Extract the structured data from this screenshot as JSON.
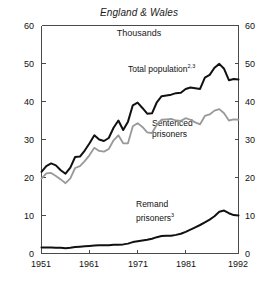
{
  "chart_data": {
    "type": "line",
    "title": "England & Wales",
    "subtitle": "Thousands",
    "xlabel": "",
    "ylabel": "Thousands",
    "xlim": [
      1951,
      1992
    ],
    "ylim": [
      0,
      60
    ],
    "yticks": [
      0,
      10,
      20,
      30,
      40,
      50,
      60
    ],
    "xticks": [
      1951,
      1961,
      1971,
      1981,
      1992
    ],
    "grid": false,
    "legend_position": "inline-annotations",
    "dual_axis": true,
    "x": [
      1951,
      1952,
      1953,
      1954,
      1955,
      1956,
      1957,
      1958,
      1959,
      1960,
      1961,
      1962,
      1963,
      1964,
      1965,
      1966,
      1967,
      1968,
      1969,
      1970,
      1971,
      1972,
      1973,
      1974,
      1975,
      1976,
      1977,
      1978,
      1979,
      1980,
      1981,
      1982,
      1983,
      1984,
      1985,
      1986,
      1987,
      1988,
      1989,
      1990,
      1991,
      1992
    ],
    "series": [
      {
        "name": "Total population",
        "footnote": "2,3",
        "color": "#111111",
        "values": [
          21.5,
          23.0,
          23.7,
          23.2,
          21.9,
          21.0,
          22.6,
          25.4,
          25.5,
          27.1,
          29.0,
          31.1,
          30.0,
          29.6,
          30.4,
          33.1,
          35.0,
          32.5,
          34.7,
          39.0,
          39.7,
          38.3,
          36.8,
          36.9,
          39.8,
          41.4,
          41.6,
          41.8,
          42.2,
          42.3,
          43.3,
          43.7,
          43.5,
          43.3,
          46.3,
          47.0,
          48.9,
          49.9,
          48.6,
          45.6,
          45.9,
          45.8
        ]
      },
      {
        "name": "Sentenced prisoners",
        "footnote": "",
        "color": "#999999",
        "values": [
          19.7,
          21.1,
          21.2,
          20.4,
          19.5,
          18.5,
          19.8,
          22.5,
          23.0,
          24.3,
          25.9,
          27.8,
          27.0,
          26.8,
          27.5,
          29.8,
          31.1,
          29.0,
          29.0,
          33.5,
          34.3,
          33.3,
          31.9,
          31.7,
          33.9,
          35.2,
          35.3,
          35.4,
          35.0,
          34.9,
          35.6,
          35.2,
          34.5,
          34.0,
          36.2,
          36.6,
          37.6,
          38.0,
          36.9,
          35.0,
          35.3,
          35.2
        ]
      },
      {
        "name": "Remand prisoners",
        "footnote": "3",
        "color": "#111111",
        "values": [
          1.6,
          1.6,
          1.6,
          1.5,
          1.5,
          1.4,
          1.5,
          1.7,
          1.8,
          1.9,
          2.0,
          2.1,
          2.2,
          2.2,
          2.2,
          2.3,
          2.3,
          2.4,
          2.6,
          3.0,
          3.2,
          3.4,
          3.6,
          3.9,
          4.3,
          4.6,
          4.7,
          4.7,
          4.9,
          5.2,
          5.7,
          6.3,
          6.9,
          7.5,
          8.2,
          8.9,
          9.8,
          11.0,
          11.3,
          10.6,
          10.1,
          10.0
        ]
      }
    ],
    "annotations": [
      {
        "id": "total-population",
        "text": "Total population",
        "sup": "2,3",
        "x_px": 128,
        "y_px": 66
      },
      {
        "id": "sentenced-prisoners",
        "text": "Sentenced",
        "text2": "prisoners",
        "sup": "",
        "x_px": 152,
        "y_px": 123
      },
      {
        "id": "remand-prisoners",
        "text": "Remand",
        "text2": "prisoners",
        "sup": "3",
        "x_px": 136,
        "y_px": 204
      }
    ]
  },
  "axis": {
    "y_left": [
      "60",
      "50",
      "40",
      "30",
      "20",
      "10",
      "0"
    ],
    "y_right": [
      "60",
      "50",
      "40",
      "30",
      "20",
      "10",
      "0"
    ],
    "x": [
      "1951",
      "1961",
      "1971",
      "1981",
      "1992"
    ]
  },
  "labels": {
    "title": "England & Wales",
    "subtitle": "Thousands",
    "total_population": "Total population",
    "total_population_sup": "2,3",
    "sentenced_line1": "Sentenced",
    "sentenced_line2": "prisoners",
    "remand_line1": "Remand",
    "remand_line2": "prisoners",
    "remand_sup": "3"
  },
  "colors": {
    "total": "#111111",
    "sentenced": "#999999",
    "remand": "#111111",
    "frame": "#4a4a4a",
    "background": "#ffffff"
  }
}
